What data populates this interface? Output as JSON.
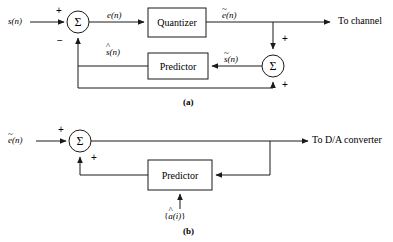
{
  "figure": {
    "panels": [
      {
        "id": "a",
        "caption": "(a)",
        "input_label_base": "s",
        "input_label_arg": "(n)",
        "error_label_base": "e",
        "error_label_arg": "(n)",
        "quantized_error_base": "e",
        "quantized_error_arg": "(n)",
        "quantized_error_accent": "~",
        "predicted_base": "s",
        "predicted_arg": "(n)",
        "predicted_accent": "^",
        "reconstructed_base": "s",
        "reconstructed_arg": "(n)",
        "reconstructed_accent": "~",
        "quantizer_label": "Quantizer",
        "predictor_label": "Predictor",
        "summer_glyph": "Σ",
        "output_label": "To channel",
        "signs": {
          "input_plus": "+",
          "feedback_minus": "−",
          "right_top_plus": "+",
          "right_bottom_plus": "+"
        }
      },
      {
        "id": "b",
        "caption": "(b)",
        "input_base": "e",
        "input_arg": "(n)",
        "input_accent": "~",
        "predictor_label": "Predictor",
        "summer_glyph": "Σ",
        "output_label": "To D/A converter",
        "coeff_open": "{",
        "coeff_base": "a",
        "coeff_arg": "(i)",
        "coeff_accent": "^",
        "coeff_close": "}",
        "signs": {
          "input_plus": "+",
          "feedback_plus": "+"
        }
      }
    ],
    "colors": {
      "line": "#1a1a1a",
      "background": "#ffffff",
      "text": "#000000"
    }
  }
}
